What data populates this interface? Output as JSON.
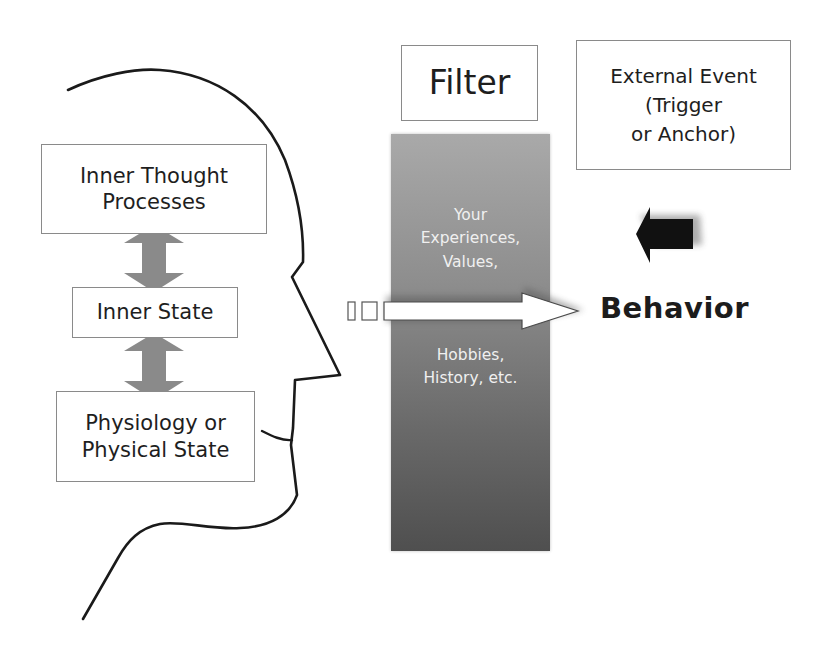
{
  "diagram": {
    "title": "Filter",
    "internal": {
      "inner_thought": {
        "lines": [
          "Inner Thought",
          "Processes"
        ]
      },
      "inner_state": {
        "lines": [
          "Inner State"
        ]
      },
      "physiology": {
        "lines": [
          "Physiology or",
          "Physical State"
        ]
      }
    },
    "filter_column": {
      "top_lines": [
        "Your",
        "Experiences,",
        "Values,"
      ],
      "bottom_lines": [
        "Hobbies,",
        "History, etc."
      ]
    },
    "external_event": {
      "lines": [
        "External Event",
        "(Trigger",
        "or Anchor)"
      ]
    },
    "output": {
      "label": "Behavior"
    },
    "arrows": [
      {
        "name": "double-arrow-thought-state",
        "type": "bidirectional",
        "color": "#7f7f7f"
      },
      {
        "name": "double-arrow-state-physiology",
        "type": "bidirectional",
        "color": "#7f7f7f"
      },
      {
        "name": "external-event-arrow",
        "direction": "left",
        "color": "#1a1a1a"
      },
      {
        "name": "behavior-arrow",
        "direction": "right",
        "color": "#ffffff"
      }
    ],
    "colors": {
      "filter_top": "#a9a9a9",
      "filter_bottom": "#4f4f4f",
      "filter_text": "#f0f0f0",
      "box_border": "#8a8a8a",
      "head_outline": "#1a1a1a"
    }
  }
}
